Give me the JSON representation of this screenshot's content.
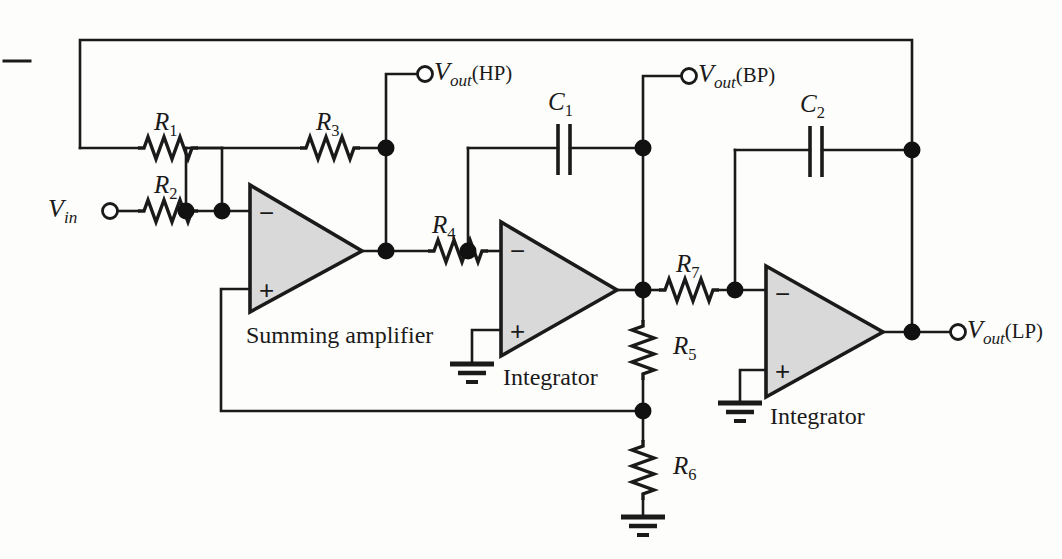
{
  "figure": {
    "type": "circuit-schematic",
    "background_color": "#fdfdfb",
    "line_color": "#1a1a1a",
    "opamp_fill": "#d9d9d9"
  },
  "components": {
    "resistors": [
      {
        "id": "R1",
        "label": "R",
        "index": "1",
        "x": 138,
        "y": 148,
        "orientation": "horizontal"
      },
      {
        "id": "R2",
        "label": "R",
        "index": "2",
        "x": 138,
        "y": 211,
        "orientation": "horizontal"
      },
      {
        "id": "R3",
        "label": "R",
        "index": "3",
        "x": 300,
        "y": 148,
        "orientation": "horizontal"
      },
      {
        "id": "R4",
        "label": "R",
        "index": "4",
        "x": 428,
        "y": 252,
        "orientation": "horizontal"
      },
      {
        "id": "R5",
        "label": "R",
        "index": "5",
        "x": 643,
        "y": 350,
        "orientation": "vertical"
      },
      {
        "id": "R6",
        "label": "R",
        "index": "6",
        "x": 643,
        "y": 470,
        "orientation": "vertical"
      },
      {
        "id": "R7",
        "label": "R",
        "index": "7",
        "x": 689,
        "y": 290,
        "orientation": "horizontal"
      }
    ],
    "capacitors": [
      {
        "id": "C1",
        "label": "C",
        "index": "1",
        "x": 564,
        "y": 148,
        "orientation": "horizontal"
      },
      {
        "id": "C2",
        "label": "C",
        "index": "2",
        "x": 816,
        "y": 150,
        "orientation": "horizontal"
      }
    ],
    "opamps": [
      {
        "id": "U1",
        "block_label": "Summing amplifier",
        "minus": "−",
        "plus": "+"
      },
      {
        "id": "U2",
        "block_label": "Integrator",
        "minus": "−",
        "plus": "+"
      },
      {
        "id": "U3",
        "block_label": "Integrator",
        "minus": "−",
        "plus": "+"
      }
    ],
    "grounds": 3,
    "terminals": [
      {
        "id": "in",
        "label": "V",
        "subscript": "in",
        "suffix": "",
        "x": 106,
        "y": 211
      },
      {
        "id": "hp",
        "label": "V",
        "subscript": "out",
        "suffix": "(HP)",
        "x": 428,
        "y": 74
      },
      {
        "id": "bp",
        "label": "V",
        "subscript": "out",
        "suffix": "(BP)",
        "x": 692,
        "y": 76
      },
      {
        "id": "lp",
        "label": "V",
        "subscript": "out",
        "suffix": "(LP)",
        "x": 930,
        "y": 332
      }
    ]
  },
  "labels": {
    "R1": {
      "base": "R",
      "sub": "1"
    },
    "R2": {
      "base": "R",
      "sub": "2"
    },
    "R3": {
      "base": "R",
      "sub": "3"
    },
    "R4": {
      "base": "R",
      "sub": "4"
    },
    "R5": {
      "base": "R",
      "sub": "5"
    },
    "R6": {
      "base": "R",
      "sub": "6"
    },
    "R7": {
      "base": "R",
      "sub": "7"
    },
    "C1": {
      "base": "C",
      "sub": "1"
    },
    "C2": {
      "base": "C",
      "sub": "2"
    },
    "Vin": {
      "base": "V",
      "sub": "in",
      "suffix": ""
    },
    "VoutHP": {
      "base": "V",
      "sub": "out",
      "suffix": "(HP)"
    },
    "VoutBP": {
      "base": "V",
      "sub": "out",
      "suffix": "(BP)"
    },
    "VoutLP": {
      "base": "V",
      "sub": "out",
      "suffix": "(LP)"
    },
    "summing_amplifier": "Summing amplifier",
    "integrator_1": "Integrator",
    "integrator_2": "Integrator",
    "minus_sign": "−",
    "plus_sign": "+"
  }
}
